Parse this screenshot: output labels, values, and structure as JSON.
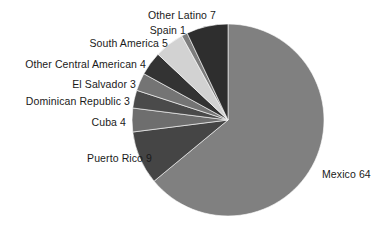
{
  "chart_data": {
    "type": "pie",
    "title": "",
    "subtitle": "",
    "xlabel": "",
    "ylabel": "",
    "legend_position": "none",
    "grid": false,
    "total": 100,
    "units": "percent",
    "start_angle_deg": 0,
    "direction": "clockwise",
    "categories": [
      "Mexico",
      "Puerto Rico",
      "Cuba",
      "Dominican Republic",
      "El Salvador",
      "Other Central American",
      "South America",
      "Spain",
      "Other Latino"
    ],
    "values": [
      64,
      9,
      4,
      3,
      3,
      4,
      5,
      1,
      7
    ],
    "slices": [
      {
        "label": "Mexico 64",
        "name": "Mexico",
        "value": 64,
        "color": "#808080"
      },
      {
        "label": "Puerto Rico 9",
        "name": "Puerto Rico",
        "value": 9,
        "color": "#454545"
      },
      {
        "label": "Cuba 4",
        "name": "Cuba",
        "value": 4,
        "color": "#6e6e6e"
      },
      {
        "label": "Dominican Republic 3",
        "name": "Dominican Republic",
        "value": 3,
        "color": "#4a4a4a"
      },
      {
        "label": "El Salvador 3",
        "name": "El Salvador",
        "value": 3,
        "color": "#747474"
      },
      {
        "label": "Other Central American 4",
        "name": "Other Central American",
        "value": 4,
        "color": "#333333"
      },
      {
        "label": "South America 5",
        "name": "South America",
        "value": 5,
        "color": "#d2d2d2"
      },
      {
        "label": "Spain 1",
        "name": "Spain",
        "value": 1,
        "color": "#7d7d7d"
      },
      {
        "label": "Other Latino 7",
        "name": "Other Latino",
        "value": 7,
        "color": "#2e2e2e"
      }
    ]
  },
  "labels": {
    "mexico": "Mexico 64",
    "puerto_rico": "Puerto Rico 9",
    "cuba": "Cuba 4",
    "dominican_republic": "Dominican Republic 3",
    "el_salvador": "El Salvador 3",
    "other_central_american": "Other Central American 4",
    "south_america": "South America 5",
    "spain": "Spain  1",
    "other_latino": "Other Latino 7"
  },
  "geometry": {
    "center_x": 228,
    "center_y": 120,
    "radius": 96
  },
  "colors": {
    "background": "#ffffff",
    "text": "#1a1a1a",
    "largest_slice": "#808080"
  }
}
